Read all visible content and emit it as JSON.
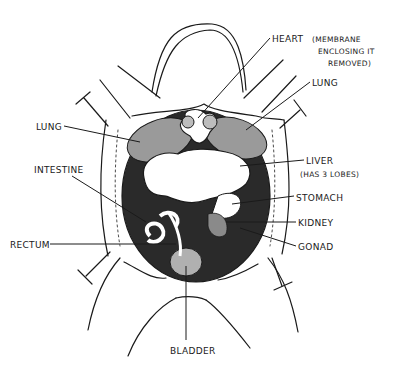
{
  "diagram": {
    "colors": {
      "ink": "#1a1a1a",
      "background": "#ffffff",
      "shade": "#4a4a4a"
    },
    "labels": [
      {
        "id": "heart",
        "text": "HEART",
        "note": "(MEMBRANE",
        "note2": "ENCLOSING IT",
        "note3": "REMOVED)",
        "x": 272,
        "y": 34
      },
      {
        "id": "lung-right",
        "text": "LUNG",
        "x": 312,
        "y": 78
      },
      {
        "id": "lung-left",
        "text": "LUNG",
        "x": 36,
        "y": 122
      },
      {
        "id": "liver",
        "text": "LIVER",
        "note": "(HAS 3 LOBES)",
        "x": 306,
        "y": 157
      },
      {
        "id": "intestine",
        "text": "INTESTINE",
        "x": 34,
        "y": 165
      },
      {
        "id": "stomach",
        "text": "STOMACH",
        "x": 296,
        "y": 193
      },
      {
        "id": "kidney",
        "text": "KIDNEY",
        "x": 298,
        "y": 218
      },
      {
        "id": "rectum",
        "text": "RECTUM",
        "x": 10,
        "y": 240
      },
      {
        "id": "gonad",
        "text": "GONAD",
        "x": 298,
        "y": 242
      },
      {
        "id": "bladder",
        "text": "BLADDER",
        "x": 170,
        "y": 346
      }
    ]
  }
}
